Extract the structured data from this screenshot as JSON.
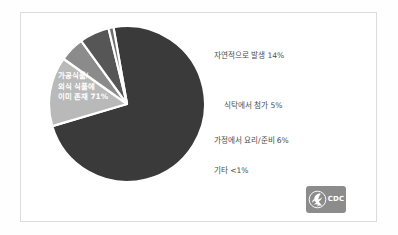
{
  "figure": {
    "background_color": "#ffffff",
    "frame_color": "#dcdcdc"
  },
  "chart_data": {
    "type": "pie",
    "title": "",
    "subtitle": "",
    "xlabel": "",
    "ylabel": "",
    "grid": false,
    "legend_position": "right-callouts",
    "start_angle_deg": -100,
    "direction": "clockwise",
    "categories": [
      "가공식품/외식 식품에 이미 존재",
      "자연적으로 발생",
      "식탁에서 첨가",
      "가정에서 요리/준비",
      "기타"
    ],
    "values": [
      71,
      14,
      5,
      6,
      1
    ],
    "value_labels": [
      "71%",
      "14%",
      "5%",
      "6%",
      "<1%"
    ],
    "colors": [
      "#3a3a3a",
      "#b9b9b9",
      "#8b8b8b",
      "#565656",
      "#6e6e6e"
    ],
    "slice_separator_color": "#ffffff",
    "inside_label": {
      "text_color": "#ffffff",
      "lines": [
        "가공식품/",
        "외식 식품에",
        "이미 존재 71%"
      ]
    },
    "callouts": [
      {
        "text": "자연적으로 발생 14%",
        "category": "자연적으로 발생",
        "value": 14
      },
      {
        "text": "식탁에서 첨가 5%",
        "category": "식탁에서 첨가",
        "value": 5
      },
      {
        "text": "가정에서 요리/준비 6%",
        "category": "가정에서 요리/준비",
        "value": 6
      },
      {
        "text": "기타 <1%",
        "category": "기타",
        "value": 1
      }
    ],
    "callout_text_color": "#4d4d4d"
  },
  "logo": {
    "name": "cdc-logo",
    "wordmark": "CDC",
    "sub_wordmark": "",
    "background_color": "#8c8c8c",
    "seal_icon": "hhs-eagle-icon"
  }
}
